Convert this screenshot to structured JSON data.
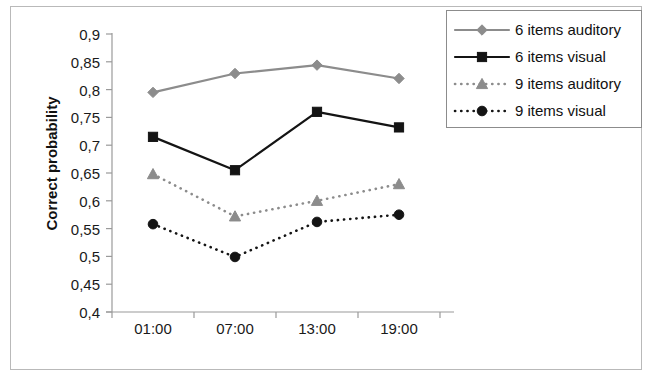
{
  "chart_data": {
    "type": "line",
    "title": "",
    "xlabel": "",
    "ylabel": "Correct probability",
    "categories": [
      "01:00",
      "07:00",
      "13:00",
      "19:00"
    ],
    "ylim": [
      0.4,
      0.9
    ],
    "ytick_labels": [
      "0,9",
      "0,85",
      "0,8",
      "0,75",
      "0,7",
      "0,65",
      "0,6",
      "0,55",
      "0,5",
      "0,45",
      "0,4"
    ],
    "ytick_values": [
      0.9,
      0.85,
      0.8,
      0.75,
      0.7,
      0.65,
      0.6,
      0.55,
      0.5,
      0.45,
      0.4
    ],
    "grid": false,
    "legend_position": "top-right",
    "series": [
      {
        "name": "6 items auditory",
        "values": [
          0.795,
          0.829,
          0.844,
          0.82
        ],
        "color": "#8c8c8c",
        "marker": "diamond",
        "dash": "solid"
      },
      {
        "name": "6 items visual",
        "values": [
          0.715,
          0.655,
          0.76,
          0.732
        ],
        "color": "#141414",
        "marker": "square",
        "dash": "solid"
      },
      {
        "name": "9 items auditory",
        "values": [
          0.648,
          0.572,
          0.6,
          0.63
        ],
        "color": "#8c8c8c",
        "marker": "triangle",
        "dash": "dotted"
      },
      {
        "name": "9 items visual",
        "values": [
          0.558,
          0.499,
          0.562,
          0.575
        ],
        "color": "#141414",
        "marker": "circle",
        "dash": "dotted"
      }
    ]
  },
  "axes": {
    "y_title": "Correct probability"
  },
  "legend": {
    "entries": [
      {
        "label": "6 items auditory"
      },
      {
        "label": "6 items visual"
      },
      {
        "label": "9 items auditory"
      },
      {
        "label": "9 items visual"
      }
    ]
  }
}
